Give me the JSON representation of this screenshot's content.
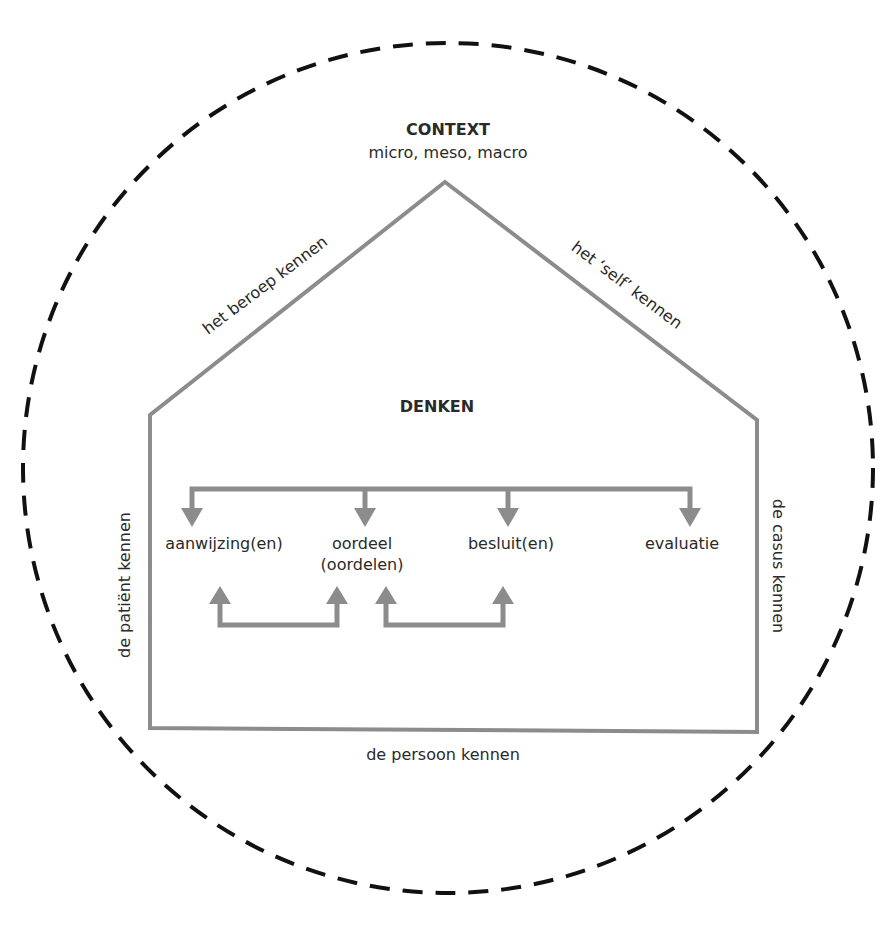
{
  "colors": {
    "house_stroke": "#8c8c8c",
    "circle_stroke": "#111111",
    "text": "#2a2a2a"
  },
  "context": {
    "title": "CONTEXT",
    "subtitle": "micro, meso, macro"
  },
  "roof": {
    "left_label": "het beroep kennen",
    "right_label": "het ‘self’ kennen"
  },
  "walls": {
    "left_label": "de patiënt kennen",
    "right_label": "de casus kennen",
    "bottom_label": "de persoon kennen"
  },
  "center": {
    "title": "DENKEN",
    "steps": [
      {
        "label": "aanwijzing(en)"
      },
      {
        "label": "oordeel",
        "sub": "(oordelen)"
      },
      {
        "label": "besluit(en)"
      },
      {
        "label": "evaluatie"
      }
    ]
  }
}
